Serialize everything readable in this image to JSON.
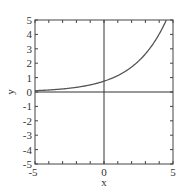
{
  "chart_data": {
    "type": "line",
    "title": "",
    "xlabel": "x",
    "ylabel": "y",
    "xlim": [
      -5,
      5
    ],
    "ylim": [
      -5,
      5
    ],
    "x_ticks": [
      -5,
      0,
      5
    ],
    "y_ticks": [
      -5,
      -4,
      -3,
      -2,
      -1,
      0,
      1,
      2,
      3,
      4,
      5
    ],
    "grid": false,
    "axes_through_origin": true,
    "series": [
      {
        "name": "curve",
        "function_estimate": "y = 0.75 * exp(0.42 x)",
        "x": [
          -5,
          -4,
          -3,
          -2,
          -1,
          0,
          1,
          2,
          3,
          4,
          4.5
        ],
        "y": [
          0.09,
          0.14,
          0.21,
          0.32,
          0.49,
          0.75,
          1.14,
          1.74,
          2.65,
          4.02,
          4.97
        ]
      }
    ],
    "colors": {
      "curve": "#555555",
      "frame": "#444444",
      "axes": "#333333"
    }
  }
}
